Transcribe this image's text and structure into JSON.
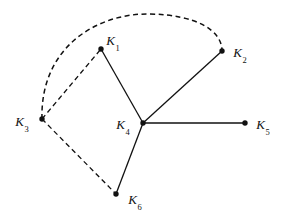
{
  "figure": {
    "width": 282,
    "height": 218,
    "background_color": "#ffffff",
    "stroke_color": "#111111",
    "node_fill_color": "#111111"
  },
  "nodes": [
    {
      "id": "K1",
      "label_base": "K",
      "label_sub": "1",
      "x": 101,
      "y": 49,
      "label_x": 113,
      "label_y": 40
    },
    {
      "id": "K2",
      "label_base": "K",
      "label_sub": "2",
      "x": 222,
      "y": 51,
      "label_x": 240,
      "label_y": 52
    },
    {
      "id": "K3",
      "label_base": "K",
      "label_sub": "3",
      "x": 42,
      "y": 119,
      "label_x": 22,
      "label_y": 121
    },
    {
      "id": "K4",
      "label_base": "K",
      "label_sub": "4",
      "x": 143,
      "y": 123,
      "label_x": 123,
      "label_y": 124
    },
    {
      "id": "K5",
      "label_base": "K",
      "label_sub": "5",
      "x": 245,
      "y": 123,
      "label_x": 263,
      "label_y": 124
    },
    {
      "id": "K6",
      "label_base": "K",
      "label_sub": "6",
      "x": 116,
      "y": 194,
      "label_x": 135,
      "label_y": 199
    }
  ],
  "edges_solid": [
    {
      "id": "edge-k1-k4",
      "from": "K1",
      "to": "K4",
      "x1": 101,
      "y1": 49,
      "x2": 143,
      "y2": 123
    },
    {
      "id": "edge-k4-k2",
      "from": "K4",
      "to": "K2",
      "x1": 143,
      "y1": 123,
      "x2": 222,
      "y2": 51
    },
    {
      "id": "edge-k4-k5",
      "from": "K4",
      "to": "K5",
      "x1": 143,
      "y1": 123,
      "x2": 245,
      "y2": 123
    },
    {
      "id": "edge-k4-k6",
      "from": "K4",
      "to": "K6",
      "x1": 143,
      "y1": 123,
      "x2": 116,
      "y2": 194
    }
  ],
  "edges_dashed": [
    {
      "id": "edge-k3-k1",
      "from": "K3",
      "to": "K1",
      "x1": 42,
      "y1": 119,
      "x2": 101,
      "y2": 49
    },
    {
      "id": "edge-k3-k6",
      "from": "K3",
      "to": "K6",
      "x1": 42,
      "y1": 119,
      "x2": 116,
      "y2": 194
    }
  ],
  "arcs_dashed": [
    {
      "id": "arc-k3-k2",
      "from": "K3",
      "to": "K2",
      "path": "M 42 119 C 40 48, 96 13, 150 14 C 196 15, 222 30, 222 51"
    }
  ],
  "style": {
    "edge_stroke_width": 1.3,
    "arc_stroke_width": 1.5,
    "dash_pattern": "5 3.5",
    "node_radius": 2.7
  },
  "chart_data": {
    "type": "diagram",
    "title": "",
    "vertices": [
      "K1",
      "K2",
      "K3",
      "K4",
      "K5",
      "K6"
    ],
    "vertex_positions": {
      "K1": [
        101,
        49
      ],
      "K2": [
        222,
        51
      ],
      "K3": [
        42,
        119
      ],
      "K4": [
        143,
        123
      ],
      "K5": [
        245,
        123
      ],
      "K6": [
        116,
        194
      ]
    },
    "edges": [
      {
        "pair": [
          "K1",
          "K4"
        ],
        "style": "solid"
      },
      {
        "pair": [
          "K4",
          "K2"
        ],
        "style": "solid"
      },
      {
        "pair": [
          "K4",
          "K5"
        ],
        "style": "solid"
      },
      {
        "pair": [
          "K4",
          "K6"
        ],
        "style": "solid"
      },
      {
        "pair": [
          "K3",
          "K1"
        ],
        "style": "dashed"
      },
      {
        "pair": [
          "K3",
          "K6"
        ],
        "style": "dashed"
      },
      {
        "pair": [
          "K3",
          "K2"
        ],
        "style": "dashed-arc"
      }
    ],
    "degree": {
      "K1": 2,
      "K2": 2,
      "K3": 3,
      "K4": 4,
      "K5": 1,
      "K6": 2
    }
  }
}
